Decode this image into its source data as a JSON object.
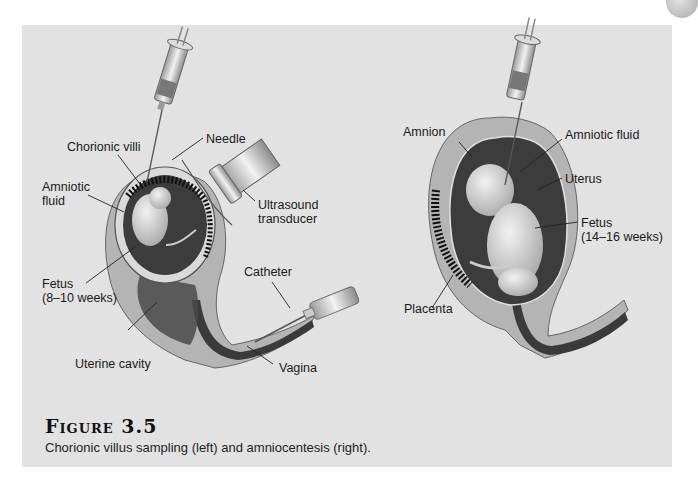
{
  "figure": {
    "title": "Figure 3.5",
    "caption": "Chorionic villus sampling (left) and amniocentesis (right)."
  },
  "left_panel": {
    "procedure": "Chorionic villus sampling",
    "labels": {
      "chorionic_villi": "Chorionic villi",
      "needle": "Needle",
      "amniotic_fluid_line1": "Amniotic",
      "amniotic_fluid_line2": "fluid",
      "ultrasound_line1": "Ultrasound",
      "ultrasound_line2": "transducer",
      "fetus_line1": "Fetus",
      "fetus_line2": "(8–10 weeks)",
      "catheter": "Catheter",
      "uterine_cavity": "Uterine cavity",
      "vagina": "Vagina"
    }
  },
  "right_panel": {
    "procedure": "Amniocentesis",
    "labels": {
      "amnion": "Amnion",
      "amniotic_fluid": "Amniotic fluid",
      "uterus": "Uterus",
      "fetus_line1": "Fetus",
      "fetus_line2": "(14–16 weeks)",
      "placenta": "Placenta"
    }
  },
  "colors": {
    "panel_bg": "#e2e2e2",
    "uterus_wall": "#b4b4b4",
    "cavity_dark": "#3c3c3c",
    "fetus": "#d8d8d8"
  }
}
